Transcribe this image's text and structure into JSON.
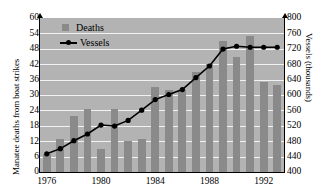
{
  "chart_data": {
    "type": "bar",
    "title": "",
    "subtitle": "",
    "xlabel": "",
    "ylabel": "Manatee deaths from boat strikes",
    "ylabel_right": "Vessels (thousands)",
    "ylim": [
      0,
      60
    ],
    "ylim_right": [
      400,
      800
    ],
    "ytick_labels": [
      "60",
      "54",
      "48",
      "42",
      "36",
      "30",
      "24",
      "18",
      "12",
      "6",
      "0"
    ],
    "ytick_values": [
      60,
      54,
      48,
      42,
      36,
      30,
      24,
      18,
      12,
      6,
      0
    ],
    "ytick_right_labels": [
      "800",
      "760",
      "720",
      "680",
      "640",
      "600",
      "560",
      "520",
      "480",
      "440",
      "400"
    ],
    "ytick_right_values": [
      800,
      760,
      720,
      680,
      640,
      600,
      560,
      520,
      480,
      440,
      400
    ],
    "xtick_labels": [
      "1976",
      "1980",
      "1984",
      "1988",
      "1992"
    ],
    "xtick_values": [
      1976,
      1980,
      1984,
      1988,
      1992
    ],
    "categories": [
      1976,
      1977,
      1978,
      1979,
      1980,
      1981,
      1982,
      1983,
      1984,
      1985,
      1986,
      1987,
      1988,
      1989,
      1990,
      1991,
      1992,
      1993
    ],
    "grid": true,
    "legend_position": "top-left",
    "series": [
      {
        "name": "Deaths",
        "type": "bar",
        "axis": "left",
        "color": "#8a8a8a",
        "values": [
          7,
          13,
          22,
          24.5,
          9,
          24.5,
          12,
          13,
          33,
          32,
          32,
          39,
          42,
          51,
          45,
          53,
          35,
          34
        ]
      },
      {
        "name": "Vessels",
        "type": "line",
        "axis": "right",
        "color": "#000000",
        "values": [
          447,
          460,
          481,
          499,
          521,
          518,
          533,
          560,
          587,
          601,
          614,
          645,
          675,
          711,
          719,
          716,
          716,
          716
        ],
        "values_left_scale": [
          7.1,
          9.1,
          12.2,
          14.8,
          18.3,
          17.9,
          20.1,
          24.1,
          28.2,
          30.2,
          32.1,
          36.8,
          41.3,
          47.9,
          49.0,
          48.6,
          48.6,
          48.6
        ]
      }
    ]
  },
  "legend": {
    "items": [
      {
        "label": "Deaths",
        "marker": "square-swatch"
      },
      {
        "label": "Vessels",
        "marker": "line-dot-swatch"
      }
    ]
  }
}
